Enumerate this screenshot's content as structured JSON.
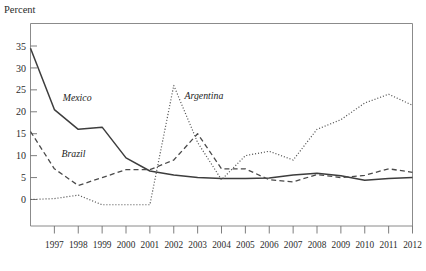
{
  "figure": {
    "axis_title": "Percent",
    "background": "#ffffff",
    "frame_color": "#7e7e7e"
  },
  "chart_data": {
    "type": "line",
    "title": "",
    "subtitle": "",
    "xlabel": "",
    "ylabel": "Percent",
    "grid": false,
    "legend_position": "inline-annotation",
    "xlim": [
      1996,
      2012
    ],
    "ylim": [
      -3,
      38
    ],
    "yticks": [
      0,
      5,
      10,
      15,
      20,
      25,
      30,
      35
    ],
    "ytick_labels": [
      "0",
      "5",
      "10",
      "15",
      "20",
      "25",
      "30",
      "35"
    ],
    "x": [
      1996,
      1997,
      1998,
      1999,
      2000,
      2001,
      2002,
      2003,
      2004,
      2005,
      2006,
      2007,
      2008,
      2009,
      2010,
      2011,
      2012
    ],
    "xtick_labels": [
      "1997",
      "1998",
      "1999",
      "2000",
      "2001",
      "2002",
      "2003",
      "2004",
      "2005",
      "2006",
      "2007",
      "2008",
      "2009",
      "2010",
      "2011",
      "2012"
    ],
    "xticks": [
      1997,
      1998,
      1999,
      2000,
      2001,
      2002,
      2003,
      2004,
      2005,
      2006,
      2007,
      2008,
      2009,
      2010,
      2011,
      2012
    ],
    "series": [
      {
        "name": "Mexico",
        "style": "solid",
        "color": "#3d3d3d",
        "width": 1.5,
        "label_x": 1997.35,
        "label_y": 22.4,
        "values": [
          34.5,
          20.5,
          16.0,
          16.5,
          9.5,
          6.5,
          5.6,
          5.0,
          4.8,
          4.8,
          4.9,
          5.6,
          6.0,
          5.4,
          4.4,
          4.8,
          5.0
        ]
      },
      {
        "name": "Brazil",
        "style": "dashed",
        "color": "#4a4a4a",
        "width": 1.3,
        "label_x": 1997.3,
        "label_y": 9.6,
        "values": [
          15.5,
          7.0,
          3.2,
          5.0,
          6.8,
          6.8,
          9.0,
          15.0,
          7.0,
          7.0,
          4.5,
          4.0,
          5.7,
          5.0,
          5.5,
          7.0,
          6.2
        ]
      },
      {
        "name": "Argentina",
        "style": "dotted",
        "color": "#575757",
        "width": 1.2,
        "label_x": 2002.45,
        "label_y": 23.0,
        "values": [
          0.0,
          0.2,
          1.0,
          -1.2,
          -1.2,
          -1.2,
          26.0,
          13.0,
          4.5,
          10.0,
          11.0,
          9.0,
          16.0,
          18.2,
          22.0,
          24.0,
          21.5
        ]
      }
    ]
  }
}
